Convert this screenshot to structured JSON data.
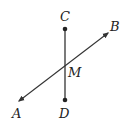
{
  "diagram": {
    "type": "geometry",
    "points": {
      "C": {
        "label": "C",
        "x": 65,
        "y": 29
      },
      "D": {
        "label": "D",
        "x": 65,
        "y": 100
      },
      "M": {
        "label": "M",
        "x": 65,
        "y": 64
      },
      "A": {
        "label": "A",
        "x": 19,
        "y": 101
      },
      "B": {
        "label": "B",
        "x": 108,
        "y": 33
      }
    },
    "elements": [
      {
        "kind": "segment",
        "from": "C",
        "to": "D",
        "endpoints": "dots"
      },
      {
        "kind": "line",
        "through": [
          "A",
          "B"
        ],
        "arrows": "both"
      }
    ],
    "colors": {
      "stroke": "#333333",
      "label": "#222222"
    }
  }
}
